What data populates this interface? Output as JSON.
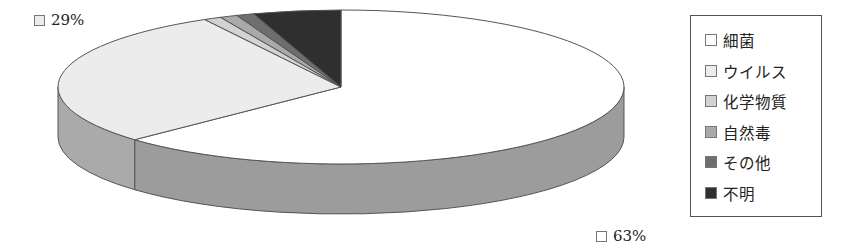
{
  "chart_data": {
    "type": "pie",
    "style": "3d",
    "title": "",
    "categories": [
      "細菌",
      "ウイルス",
      "化学物質",
      "自然毒",
      "その他",
      "不明"
    ],
    "values": [
      63,
      29,
      1,
      1,
      1,
      5
    ],
    "colors": [
      "#ffffff",
      "#ececec",
      "#d2d2d2",
      "#a9a9a9",
      "#6e6e6e",
      "#2f2f2f"
    ],
    "data_labels": [
      {
        "category": "細菌",
        "text": "63%"
      },
      {
        "category": "ウイルス",
        "text": "29%"
      }
    ],
    "legend_position": "right"
  },
  "labels": {
    "virus_pct": "29%",
    "bacteria_pct": "63%"
  },
  "legend": {
    "items": [
      {
        "label": "細菌",
        "color": "#ffffff"
      },
      {
        "label": "ウイルス",
        "color": "#ececec"
      },
      {
        "label": "化学物質",
        "color": "#d2d2d2"
      },
      {
        "label": "自然毒",
        "color": "#a9a9a9"
      },
      {
        "label": "その他",
        "color": "#6e6e6e"
      },
      {
        "label": "不明",
        "color": "#2f2f2f"
      }
    ]
  }
}
